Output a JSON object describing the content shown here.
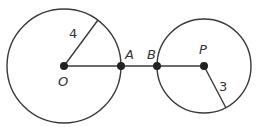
{
  "diagram": {
    "colors": {
      "stroke": "#3a3a3a",
      "point": "#222222",
      "text": "#333333"
    },
    "circles": [
      {
        "name": "circle-O",
        "center_label": "O",
        "cx": 64,
        "cy": 66,
        "r": 57,
        "radius_label": "4"
      },
      {
        "name": "circle-P",
        "center_label": "P",
        "cx": 204,
        "cy": 66,
        "r": 47,
        "radius_label": "3"
      }
    ],
    "points": {
      "O": "O",
      "A": "A",
      "B": "B",
      "P": "P"
    },
    "radius_labels": {
      "left": "4",
      "right": "3"
    }
  }
}
